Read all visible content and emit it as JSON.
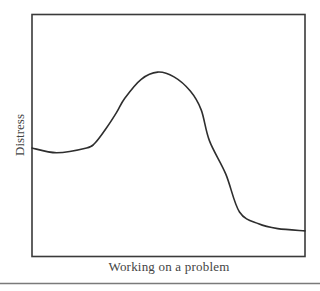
{
  "chart_data": {
    "type": "line",
    "title": "",
    "xlabel": "Working on a problem",
    "ylabel": "Distress",
    "x_ticks": [],
    "y_ticks": [],
    "grid": false,
    "legend": null,
    "xlim": [
      0,
      100
    ],
    "ylim": [
      0,
      100
    ],
    "series": [
      {
        "name": "Distress",
        "x": [
          0,
          9,
          20,
          23,
          27,
          31,
          34,
          40,
          46,
          52,
          58,
          62,
          65,
          71,
          76,
          83,
          90,
          100
        ],
        "y": [
          46,
          44,
          46,
          48,
          54,
          61,
          67,
          75,
          78,
          76,
          70,
          62,
          49,
          35,
          19,
          14,
          12,
          11
        ]
      }
    ]
  },
  "figure": {
    "separator_rule": true,
    "line_color": "#2e2e2e"
  }
}
